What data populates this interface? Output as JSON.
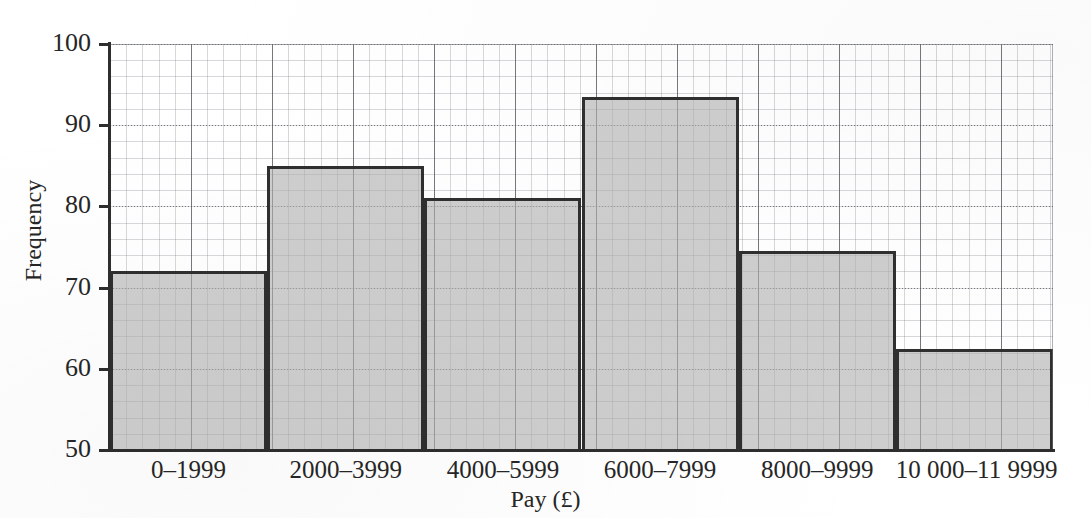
{
  "chart_data": {
    "type": "bar",
    "title": "",
    "subtitle": "",
    "xlabel": "Pay (£)",
    "ylabel": "Frequency",
    "categories": [
      "0–1999",
      "2000–3999",
      "4000–5999",
      "6000–7999",
      "8000–9999",
      "10 000–11 9999"
    ],
    "values": [
      72,
      85,
      81,
      93.5,
      74.5,
      62.5
    ],
    "ylim": [
      50,
      100
    ],
    "yticks": [
      50,
      60,
      70,
      80,
      90,
      100
    ],
    "ytick_labels": [
      "50",
      "60",
      "70",
      "80",
      "90",
      "100"
    ],
    "grid": true,
    "grid_minor": true,
    "legend": "none",
    "bar_fill_color": "#b0b0b0",
    "bar_edge_color": "#2f2f2f",
    "axis_color": "#2e2e2e",
    "background_color": "#ffffff"
  },
  "axes": {
    "y_title": "Frequency",
    "x_title": "Pay (£)"
  }
}
